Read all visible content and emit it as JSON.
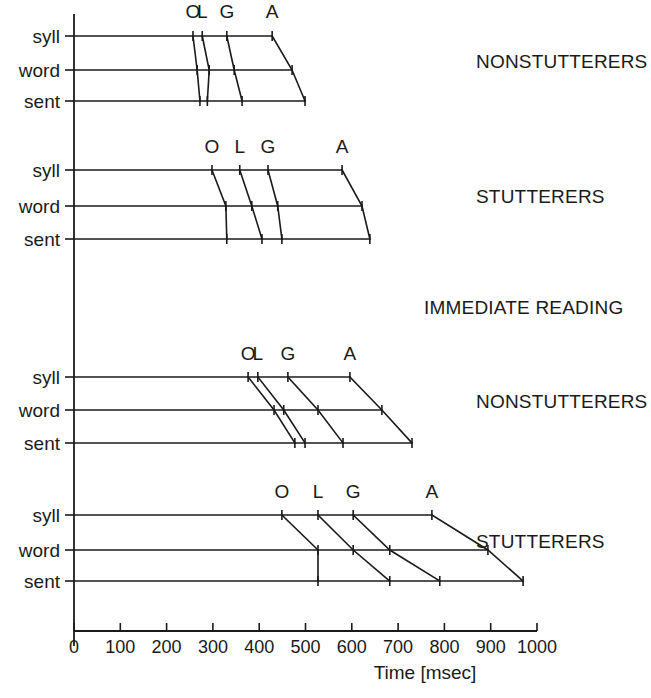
{
  "figure": {
    "axis": {
      "xlabel": "Time [msec]",
      "ticks": [
        "0",
        "100",
        "200",
        "300",
        "400",
        "500",
        "600",
        "700",
        "800",
        "900",
        "1000"
      ],
      "xlim": [
        0,
        1000
      ]
    },
    "row_labels": [
      "syll",
      "word",
      "sent"
    ],
    "marker_labels": [
      "O",
      "L",
      "G",
      "A"
    ],
    "condition_label": "IMMEDIATE READING",
    "group_labels": {
      "p1": "NONSTUTTERERS",
      "p2": "STUTTERERS",
      "p3": "NONSTUTTERERS",
      "p4": "STUTTERERS"
    }
  },
  "chart_data": {
    "type": "line",
    "title": "",
    "xlabel": "Time [msec]",
    "ylabel": "",
    "xlim": [
      0,
      1000
    ],
    "grid": false,
    "legend": "none",
    "rows": [
      "syll",
      "word",
      "sent"
    ],
    "events": [
      "O",
      "L",
      "G",
      "A"
    ],
    "panels": [
      {
        "group": "NONSTUTTERERS",
        "condition": "IMMEDIATE READING",
        "syll": {
          "O": 257,
          "L": 277,
          "G": 330,
          "A": 428,
          "end": 428
        },
        "word": {
          "O": 266,
          "L": 292,
          "G": 346,
          "A": 471,
          "end": 471
        },
        "sent": {
          "O": 272,
          "L": 288,
          "G": 363,
          "A": 499,
          "end": 499
        }
      },
      {
        "group": "STUTTERERS",
        "condition": "IMMEDIATE READING",
        "syll": {
          "O": 298,
          "L": 358,
          "G": 419,
          "A": 579,
          "end": 579
        },
        "word": {
          "O": 328,
          "L": 384,
          "G": 440,
          "A": 622,
          "end": 622
        },
        "sent": {
          "O": 330,
          "L": 406,
          "G": 449,
          "A": 639,
          "end": 639
        }
      },
      {
        "group": "NONSTUTTERERS",
        "condition": "DELAYED READING",
        "syll": {
          "O": 376,
          "L": 397,
          "G": 462,
          "A": 596,
          "end": 596
        },
        "word": {
          "O": 432,
          "L": 453,
          "G": 527,
          "A": 665,
          "end": 665
        },
        "sent": {
          "O": 477,
          "L": 499,
          "G": 581,
          "A": 730,
          "end": 730
        }
      },
      {
        "group": "STUTTERERS",
        "condition": "DELAYED READING",
        "syll": {
          "O": 449,
          "L": 527,
          "G": 603,
          "A": 773,
          "end": 773
        },
        "word": {
          "O": 527,
          "L": 603,
          "G": 682,
          "A": 894,
          "end": 894
        },
        "sent": {
          "O": 527,
          "L": 682,
          "G": 790,
          "A": 970,
          "end": 970
        }
      }
    ]
  }
}
